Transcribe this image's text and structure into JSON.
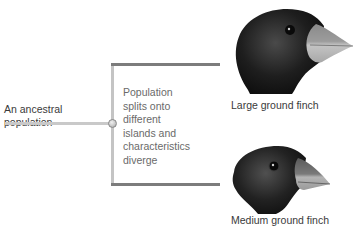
{
  "diagram": {
    "ancestral_label": "An ancestral population",
    "ancestral_lines": [
      "An ancestral",
      "population"
    ],
    "split_label": "Population splits onto different islands and characteristics diverge",
    "split_lines": [
      "Population",
      "splits onto",
      "different",
      "islands and",
      "characteristics",
      "diverge"
    ],
    "branches": [
      {
        "label": "Large ground finch",
        "beak": "large"
      },
      {
        "label": "Medium ground finch",
        "beak": "medium"
      }
    ]
  },
  "colors": {
    "stem": "#c9c9c9",
    "branch_vertical": "#c4c4c4",
    "branch_horizontal": "#7c7c7c",
    "bird_body": "#1e1e1e",
    "beak": "#b8b8b8"
  }
}
